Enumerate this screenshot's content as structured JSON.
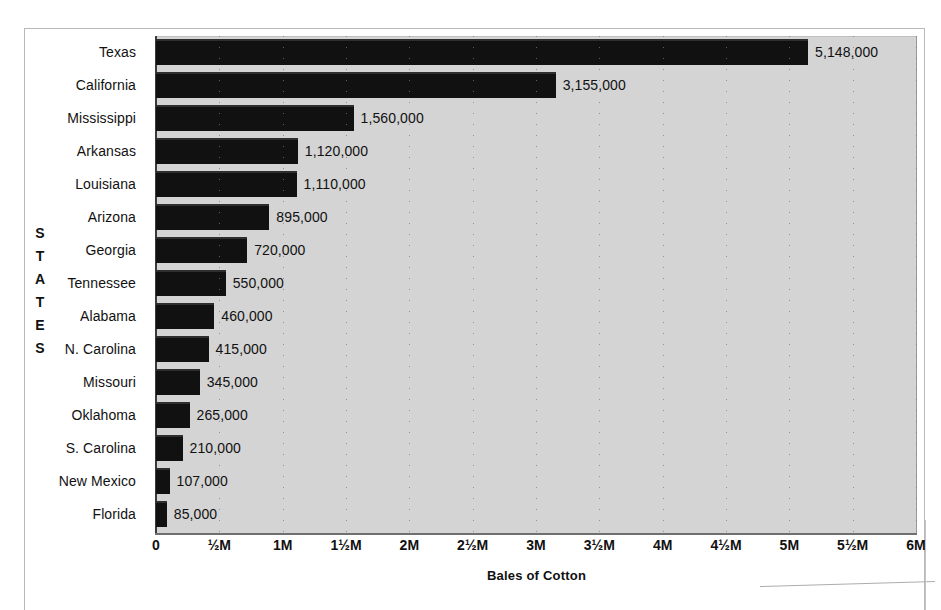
{
  "chart_data": {
    "type": "bar",
    "orientation": "horizontal",
    "title": "",
    "xlabel": "Bales of Cotton",
    "ylabel": "STATES",
    "categories": [
      "Texas",
      "California",
      "Mississippi",
      "Arkansas",
      "Louisiana",
      "Arizona",
      "Georgia",
      "Tennessee",
      "Alabama",
      "N. Carolina",
      "Missouri",
      "Oklahoma",
      "S. Carolina",
      "New Mexico",
      "Florida"
    ],
    "values": [
      5148000,
      3155000,
      1560000,
      1120000,
      1110000,
      895000,
      720000,
      550000,
      460000,
      415000,
      345000,
      265000,
      210000,
      107000,
      85000
    ],
    "value_labels": [
      "5,148,000",
      "3,155,000",
      "1,560,000",
      "1,120,000",
      "1,110,000",
      "895,000",
      "720,000",
      "550,000",
      "460,000",
      "415,000",
      "345,000",
      "265,000",
      "210,000",
      "107,000",
      "85,000"
    ],
    "xlim": [
      0,
      6000000
    ],
    "xticks": [
      0,
      500000,
      1000000,
      1500000,
      2000000,
      2500000,
      3000000,
      3500000,
      4000000,
      4500000,
      5000000,
      5500000,
      6000000
    ],
    "xtick_labels": [
      "0",
      "½M",
      "1M",
      "1½M",
      "2M",
      "2½M",
      "3M",
      "3½M",
      "4M",
      "4½M",
      "5M",
      "5½M",
      "6M"
    ],
    "grid": true,
    "grid_style": "dotted-vertical",
    "legend": null,
    "bar_color": "#111111",
    "plot_background": "#d4d4d4",
    "figure_background": "#ffffff"
  },
  "axis": {
    "y_title_letters": [
      "S",
      "T",
      "A",
      "T",
      "E",
      "S"
    ]
  }
}
